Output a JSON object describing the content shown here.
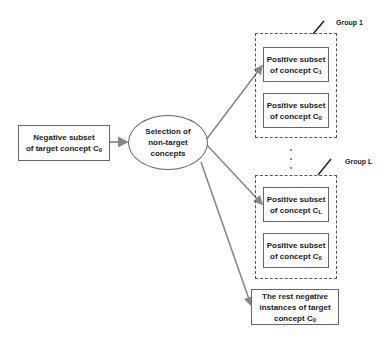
{
  "diagram": {
    "source": {
      "line1": "Negative subset",
      "line2": "of target concept C",
      "sub": "0"
    },
    "selector": {
      "line1": "Selection of",
      "line2": "non-target",
      "line3": "concepts"
    },
    "groups": [
      {
        "label": "Group 1",
        "boxes": [
          {
            "line1": "Positive subset",
            "line2": "of concept C",
            "sub": "1"
          },
          {
            "line1": "Positive subset",
            "line2": "of concept C",
            "sub": "0"
          }
        ]
      },
      {
        "label": "Group L",
        "boxes": [
          {
            "line1": "Positive subset",
            "line2": "of concept C",
            "sub": "L"
          },
          {
            "line1": "Positive subset",
            "line2": "of concept C",
            "sub": "0"
          }
        ]
      }
    ],
    "ellipsis": "⋮",
    "rest": {
      "line1": "The rest negative",
      "line2": "instances of target",
      "line3": "concept C",
      "sub": "0"
    },
    "colors": {
      "arrow": "#888888",
      "border": "#666666",
      "dashed": "#555555"
    }
  }
}
